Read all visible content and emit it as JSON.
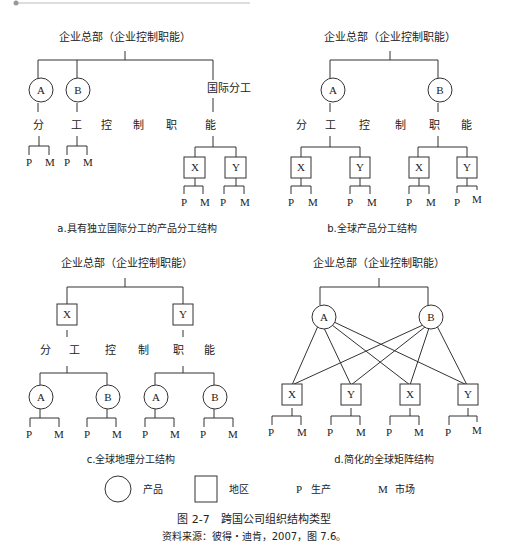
{
  "figure": {
    "title": "图 2-7　跨国公司组织结构类型",
    "source": "资料来源：彼得・迪肯，2007，图 7.6。"
  },
  "legend": {
    "circle_label": "产品",
    "square_label": "地区",
    "p_symbol": "P",
    "p_label": "生产",
    "m_symbol": "M",
    "m_label": "市场"
  },
  "panels": {
    "a": {
      "hq": "企业总部（企业控制职能）",
      "intl": "国际分工",
      "nodes": [
        "A",
        "B",
        "X",
        "Y"
      ],
      "division_chars": [
        "分",
        "工",
        "控",
        "制",
        "职",
        "能"
      ],
      "caption": "a.具有独立国际分工的产品分工结构"
    },
    "b": {
      "hq": "企业总部（企业控制职能）",
      "nodes": [
        "A",
        "B",
        "X",
        "Y",
        "X",
        "Y"
      ],
      "division_chars": [
        "分",
        "工",
        "控",
        "制",
        "职",
        "能"
      ],
      "caption": "b.全球产品分工结构"
    },
    "c": {
      "hq": "企业总部（企业控制职能）",
      "nodes": [
        "X",
        "Y",
        "A",
        "B",
        "A",
        "B"
      ],
      "division_chars": [
        "分",
        "工",
        "控",
        "制",
        "职",
        "能"
      ],
      "caption": "c.全球地理分工结构"
    },
    "d": {
      "hq": "企业总部（企业控制职能）",
      "nodes": [
        "A",
        "B",
        "X",
        "Y",
        "X",
        "Y"
      ],
      "caption": "d.简化的全球矩阵结构"
    }
  },
  "leaf": {
    "p": "P",
    "m": "M"
  }
}
